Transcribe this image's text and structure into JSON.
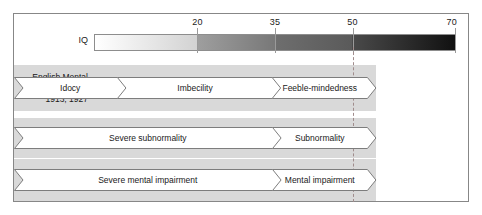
{
  "figure": {
    "border_color": "#878787",
    "background": "#ffffff"
  },
  "scale": {
    "axis_label": "IQ",
    "min": 0,
    "max": 70,
    "ticks": [
      {
        "value": 20,
        "label": "20"
      },
      {
        "value": 35,
        "label": "35"
      },
      {
        "value": 50,
        "label": "50"
      },
      {
        "value": 70,
        "label": "70"
      }
    ],
    "gradient_segments": [
      {
        "from": 0,
        "to": 20,
        "start_color": "#ffffff",
        "end_color": "#d2d2d2"
      },
      {
        "from": 20,
        "to": 35,
        "start_color": "#9e9e9e",
        "end_color": "#787878"
      },
      {
        "from": 35,
        "to": 50,
        "start_color": "#6e6e6e",
        "end_color": "#5a5a5a"
      },
      {
        "from": 50,
        "to": 70,
        "start_color": "#4a4a4a",
        "end_color": "#111111"
      }
    ]
  },
  "divider": {
    "at_value": 50,
    "style": "dashed",
    "color": "#a08c8c"
  },
  "rows": [
    {
      "label": "English Mental\nDeficiency Acts\n1913, 1927",
      "label_lines": [
        "English Mental",
        "Deficiency Acts",
        "1913, 1927"
      ],
      "band_color": "#d9d9d9",
      "segments": [
        {
          "text": "Idocy",
          "from": 0,
          "to": 20
        },
        {
          "text": "Imbecility",
          "from": 20,
          "to": 50
        },
        {
          "text": "Feeble-mindedness",
          "from": 50,
          "to": 70
        }
      ]
    },
    {
      "label": "English MHA\n1959",
      "label_lines": [
        "English MHA",
        "1959"
      ],
      "band_color": "#d9d9d9",
      "segments": [
        {
          "text": "Severe subnormality",
          "from": 0,
          "to": 50
        },
        {
          "text": "Subnormality",
          "from": 50,
          "to": 70
        }
      ]
    },
    {
      "label": "English MHA\n1983",
      "label_lines": [
        "English MHA",
        "1983"
      ],
      "band_color": "#d9d9d9",
      "segments": [
        {
          "text": "Severe mental impairment",
          "from": 0,
          "to": 50
        },
        {
          "text": "Mental impairment",
          "from": 50,
          "to": 70
        }
      ]
    }
  ]
}
